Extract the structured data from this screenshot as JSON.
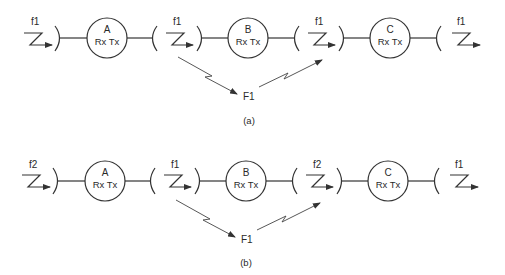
{
  "diagram": {
    "type": "radio relay frequency plan",
    "panels": [
      {
        "caption": "(a)",
        "stations": [
          {
            "name": "A",
            "label": "Rx Tx"
          },
          {
            "name": "B",
            "label": "Rx Tx"
          },
          {
            "name": "C",
            "label": "Rx Tx"
          }
        ],
        "links": [
          {
            "position": "input to A",
            "frequency": "f1"
          },
          {
            "position": "A to B",
            "frequency": "f1"
          },
          {
            "position": "B to C",
            "frequency": "f1"
          },
          {
            "position": "output of C",
            "frequency": "f1"
          }
        ],
        "interference": {
          "label": "F1",
          "from": "A to B hop",
          "to": "B to C hop"
        }
      },
      {
        "caption": "(b)",
        "stations": [
          {
            "name": "A",
            "label": "Rx Tx"
          },
          {
            "name": "B",
            "label": "Rx Tx"
          },
          {
            "name": "C",
            "label": "Rx Tx"
          }
        ],
        "links": [
          {
            "position": "input to A",
            "frequency": "f2"
          },
          {
            "position": "A to B",
            "frequency": "f1"
          },
          {
            "position": "B to C",
            "frequency": "f2"
          },
          {
            "position": "output of C",
            "frequency": "f1"
          }
        ],
        "interference": {
          "label": "F1",
          "from": "A to B hop",
          "to": "B to C hop"
        }
      }
    ]
  }
}
